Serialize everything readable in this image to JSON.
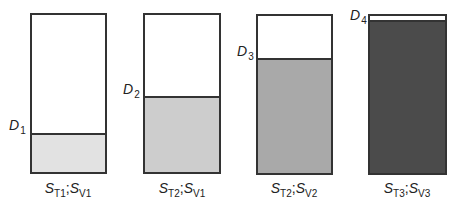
{
  "diagram": {
    "tanks": [
      {
        "id": "1",
        "level_label": {
          "main": "D",
          "sub": "1"
        },
        "caption": {
          "s1": "S",
          "s1_sub": "T1",
          "sep": ";",
          "s2": "S",
          "s2_sub": "V1"
        },
        "box": {
          "left": 30,
          "top": 13,
          "width": 77,
          "height": 161
        },
        "fill_top": 133,
        "fill_color": "#e2e2e2",
        "label_pos": {
          "x": 9,
          "y": 118
        },
        "caption_x": 18
      },
      {
        "id": "2",
        "level_label": {
          "main": "D",
          "sub": "2"
        },
        "caption": {
          "s1": "S",
          "s1_sub": "T2",
          "sep": ";",
          "s2": "S",
          "s2_sub": "V1"
        },
        "box": {
          "left": 143,
          "top": 13,
          "width": 78,
          "height": 161
        },
        "fill_top": 96,
        "fill_color": "#cdcdcd",
        "label_pos": {
          "x": 123,
          "y": 82
        },
        "caption_x": 132
      },
      {
        "id": "3",
        "level_label": {
          "main": "D",
          "sub": "3"
        },
        "caption": {
          "s1": "S",
          "s1_sub": "T2",
          "sep": ";",
          "s2": "S",
          "s2_sub": "V2"
        },
        "box": {
          "left": 256,
          "top": 14,
          "width": 77,
          "height": 161
        },
        "fill_top": 58,
        "fill_color": "#a9a9a9",
        "label_pos": {
          "x": 237,
          "y": 44
        },
        "caption_x": 244
      },
      {
        "id": "4",
        "level_label": {
          "main": "D",
          "sub": "4"
        },
        "caption": {
          "s1": "S",
          "s1_sub": "T3",
          "sep": ";",
          "s2": "S",
          "s2_sub": "V3"
        },
        "box": {
          "left": 368,
          "top": 14,
          "width": 79,
          "height": 161
        },
        "fill_top": 20,
        "fill_color": "#4b4b4b",
        "label_pos": {
          "x": 350,
          "y": 8
        },
        "caption_x": 357
      }
    ]
  }
}
